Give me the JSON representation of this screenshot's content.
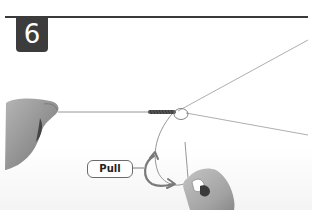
{
  "step": {
    "number": "6"
  },
  "callout": {
    "label": "Pull"
  },
  "colors": {
    "badge": "#3c3c3c",
    "rule": "#3a3a3a",
    "line": "#8a8a8a",
    "arrow": "#7a7a7a",
    "skin": "#9a9a9a"
  },
  "illustration": {
    "subject": "fishing-knot-tying-step",
    "elements": [
      "left-hand-holding-line",
      "knot-wrap",
      "tag-end-loop",
      "right-hand-pulling-tag-end",
      "pull-arrow",
      "main-line-upper",
      "main-line-lower"
    ]
  }
}
